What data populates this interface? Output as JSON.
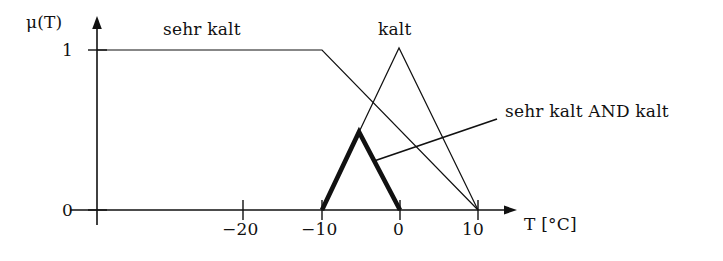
{
  "figure": {
    "title": "",
    "type": "fuzzy-membership-plot",
    "axes": {
      "y_axis_label": "μ(T)",
      "x_axis_label": "T [°C]",
      "y_ticks": [
        {
          "value": 1,
          "label": "1",
          "px_y": 50
        },
        {
          "value": 0,
          "label": "0",
          "px_y": 210
        }
      ],
      "x_ticks": [
        {
          "value": -20,
          "label": "−20",
          "px_x": 243
        },
        {
          "value": -10,
          "label": "−10",
          "px_x": 322
        },
        {
          "value": 0,
          "label": "0",
          "px_x": 400
        },
        {
          "value": 10,
          "label": "10",
          "px_x": 478
        }
      ],
      "x_origin_px": 97,
      "x_axis_end_px": 515,
      "y_axis_top_px": 18,
      "y_axis_bottom_px": 225,
      "px_per_10deg": 78.5
    },
    "curves": [
      {
        "name": "sehr kalt",
        "label": "sehr kalt",
        "style": "thin",
        "shape": "trapezoid",
        "points_px": [
          [
            97,
            50
          ],
          [
            322,
            50
          ],
          [
            478,
            210
          ]
        ],
        "points_data": [
          [
            -38.6,
            1
          ],
          [
            -10,
            1
          ],
          [
            10,
            0
          ]
        ]
      },
      {
        "name": "kalt",
        "label": "kalt",
        "style": "thin",
        "shape": "triangle",
        "points_px": [
          [
            322,
            210
          ],
          [
            399,
            48
          ],
          [
            478,
            210
          ]
        ],
        "points_data": [
          [
            -10,
            0
          ],
          [
            0,
            1
          ],
          [
            10,
            0
          ]
        ]
      },
      {
        "name": "sehr kalt AND kalt",
        "label": "sehr kalt AND kalt",
        "style": "bold",
        "shape": "min-intersection-triangle",
        "points_px": [
          [
            322,
            210
          ],
          [
            359,
            132
          ],
          [
            400,
            210
          ]
        ],
        "points_data": [
          [
            -10,
            0
          ],
          [
            -5.3,
            0.5
          ],
          [
            0,
            0
          ]
        ]
      }
    ],
    "annotation": {
      "text": "sehr kalt AND kalt",
      "leader_line_px": [
        [
          374,
          161
        ],
        [
          497,
          119
        ]
      ]
    },
    "colors": {
      "ink": "#111111",
      "background": "#ffffff"
    }
  }
}
